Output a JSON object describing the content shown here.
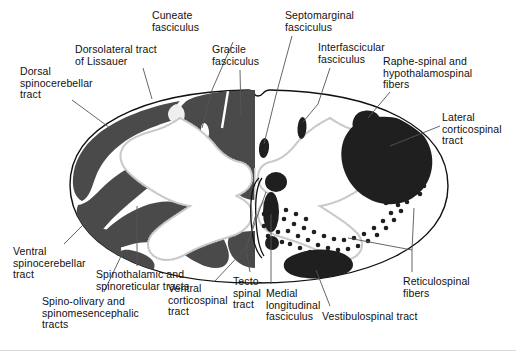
{
  "figure": {
    "type": "anatomical-cross-section",
    "canvas": {
      "width": 516,
      "height": 351,
      "background": "#ffffff"
    },
    "colors": {
      "tract_fill": "#4a4a4a",
      "dark_nucleus": "#2b2b2b",
      "gray_matter_fill": "#ffffff",
      "gray_matter_stipple": "#c9c9c9",
      "outline": "#111111",
      "leader_line": "#555555",
      "text": "#111111",
      "bottom_rule": "#d8d8d8"
    }
  },
  "labels": [
    {
      "id": "cuneate-fasciculus",
      "text": "Cuneate\nfasciculus",
      "x": 152,
      "y": 10,
      "align": "left"
    },
    {
      "id": "septomarginal-fasciculus",
      "text": "Septomarginal\nfasciculus",
      "x": 285,
      "y": 10,
      "align": "left"
    },
    {
      "id": "dorsolateral-tract",
      "text": "Dorsolateral tract\nof Lissauer",
      "x": 75,
      "y": 44,
      "align": "left"
    },
    {
      "id": "gracile-fasciculus",
      "text": "Gracile\nfasciculus",
      "x": 212,
      "y": 44,
      "align": "left"
    },
    {
      "id": "interfascicular-fasciculus",
      "text": "Interfascicular\nfasciculus",
      "x": 318,
      "y": 42,
      "align": "left"
    },
    {
      "id": "raphe-spinal-fibers",
      "text": "Raphe-spinal and\nhypothalamospinal\nfibers",
      "x": 383,
      "y": 56,
      "align": "left"
    },
    {
      "id": "dorsal-spinocerebellar",
      "text": "Dorsal\nspinocerebellar\ntract",
      "x": 20,
      "y": 66,
      "align": "left"
    },
    {
      "id": "lateral-corticospinal",
      "text": "Lateral\ncorticospinal\ntract",
      "x": 442,
      "y": 112,
      "align": "left"
    },
    {
      "id": "ventral-spinocerebellar",
      "text": "Ventral\nspinocerebellar\ntract",
      "x": 13,
      "y": 246,
      "align": "left"
    },
    {
      "id": "spinothalamic-tracts",
      "text": "Spinothalamic and\nspinoreticular tracts",
      "x": 96,
      "y": 269,
      "align": "left"
    },
    {
      "id": "spino-olivary-tracts",
      "text": "Spino-olivary and\nspinomesencephalic\ntracts",
      "x": 42,
      "y": 296,
      "align": "left"
    },
    {
      "id": "ventral-corticospinal",
      "text": "Ventral\ncorticospinal\ntract",
      "x": 168,
      "y": 283,
      "align": "left"
    },
    {
      "id": "tecto-spinal-tract",
      "text": "Tecto-\nspinal\ntract",
      "x": 233,
      "y": 276,
      "align": "left"
    },
    {
      "id": "medial-longitudinal",
      "text": "Medial\nlongitudinal\nfasciculus",
      "x": 266,
      "y": 288,
      "align": "left"
    },
    {
      "id": "vestibulospinal-tract",
      "text": "Vestibulospinal tract",
      "x": 322,
      "y": 311,
      "align": "left"
    },
    {
      "id": "reticulospinal-fibers",
      "text": "Reticulospinal\nfibers",
      "x": 403,
      "y": 276,
      "align": "left"
    }
  ],
  "leaders": [
    {
      "id": "leader-cuneate",
      "points": "233,42 212,90 202,128"
    },
    {
      "id": "leader-septomarginal",
      "points": "292,36 276,95 264,144"
    },
    {
      "id": "leader-dorsolateral",
      "points": "143,68 152,98"
    },
    {
      "id": "leader-gracile",
      "points": "240,70 241,116"
    },
    {
      "id": "leader-interfascicular",
      "points": "330,68 320,103 302,128"
    },
    {
      "id": "leader-raphe",
      "points": "390,92 368,118"
    },
    {
      "id": "leader-dorsal-spinocereb",
      "points": "72,100 108,128"
    },
    {
      "id": "leader-lateral-cst",
      "points": "440,126 390,146"
    },
    {
      "id": "leader-ventral-spinocereb",
      "points": "64,244 88,218"
    },
    {
      "id": "leader-spinothalamic",
      "points": "137,266 137,205"
    },
    {
      "id": "leader-spino-olivary",
      "points": "104,292 120,252"
    },
    {
      "id": "leader-ventral-cst",
      "points": "214,282 244,250 250,208"
    },
    {
      "id": "leader-tecto-spinal",
      "points": "248,272 243,250 256,214"
    },
    {
      "id": "leader-mlf",
      "points": "271,284 271,212"
    },
    {
      "id": "leader-vestibulospinal",
      "points": "330,306 314,270"
    },
    {
      "id": "leader-reticulospinal",
      "points": "410,272 410,252 348,238"
    },
    {
      "id": "leader-reticulospinal-2",
      "points": "410,252 413,213"
    }
  ],
  "regions": [
    {
      "id": "dorsal-spinocerebellar-tract",
      "side": "left",
      "shade": "tract_fill"
    },
    {
      "id": "dorsolateral-tract-of-lissauer",
      "side": "left",
      "shade": "gray_matter_fill"
    },
    {
      "id": "gracile-fasciculus",
      "side": "left",
      "shade": "tract_fill"
    },
    {
      "id": "cuneate-fasciculus",
      "side": "left",
      "shade": "tract_fill"
    },
    {
      "id": "ventral-spinocerebellar-tract",
      "side": "left",
      "shade": "tract_fill"
    },
    {
      "id": "spinothalamic-and-spinoreticular-tracts",
      "side": "left",
      "shade": "tract_fill"
    },
    {
      "id": "spino-olivary-and-spinomesencephalic-tracts",
      "side": "left",
      "shade": "tract_fill"
    },
    {
      "id": "septomarginal-fasciculus",
      "side": "right",
      "shade": "dark_nucleus"
    },
    {
      "id": "interfascicular-fasciculus",
      "side": "right",
      "shade": "dark_nucleus"
    },
    {
      "id": "raphe-spinal-and-hypothalamospinal-fibers",
      "side": "right",
      "shade": "dark_nucleus"
    },
    {
      "id": "lateral-corticospinal-tract",
      "side": "right",
      "shade": "dark_nucleus"
    },
    {
      "id": "reticulospinal-fibers",
      "side": "right",
      "shade": "stipple-dots"
    },
    {
      "id": "vestibulospinal-tract",
      "side": "right",
      "shade": "dark_nucleus"
    },
    {
      "id": "medial-longitudinal-fasciculus",
      "side": "right",
      "shade": "dark_nucleus"
    },
    {
      "id": "tecto-spinal-tract",
      "side": "right",
      "shade": "outline-only"
    },
    {
      "id": "ventral-corticospinal-tract",
      "side": "right",
      "shade": "dark_nucleus"
    }
  ]
}
